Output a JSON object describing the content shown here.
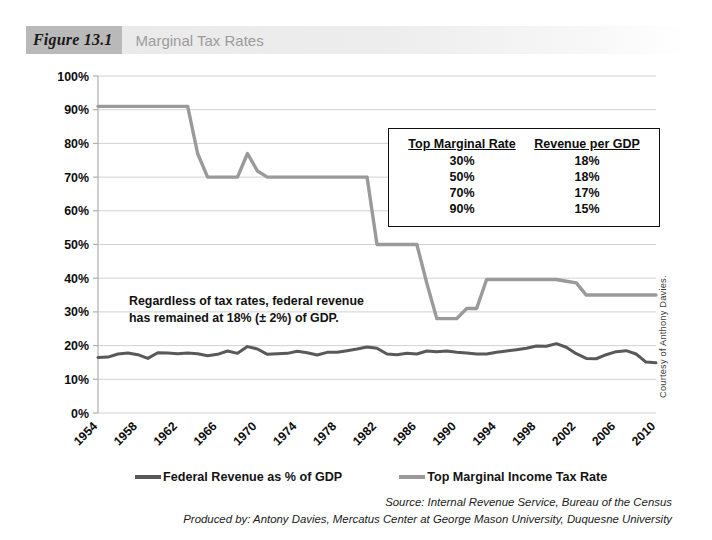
{
  "figure": {
    "badge": "Figure 13.1",
    "title": "Marginal Tax Rates"
  },
  "annotation": {
    "line1": "Regardless of tax rates, federal revenue",
    "line2": "has remained at 18% (± 2%) of GDP."
  },
  "inset_table": {
    "headers": [
      "Top Marginal Rate",
      "Revenue per GDP"
    ],
    "rows": [
      [
        "30%",
        "18%"
      ],
      [
        "50%",
        "18%"
      ],
      [
        "70%",
        "17%"
      ],
      [
        "90%",
        "15%"
      ]
    ]
  },
  "legend": {
    "items": [
      {
        "label": "Federal Revenue as % of GDP",
        "color": "#595959"
      },
      {
        "label": "Top Marginal Income Tax Rate",
        "color": "#9a9a9a"
      }
    ]
  },
  "source": {
    "line1": "Source: Internal Revenue Service, Bureau of the Census",
    "line2": "Produced by: Antony Davies, Mercatus Center at George Mason University, Duquesne University"
  },
  "credit": "Courtesy of Anthony Davies.",
  "colors": {
    "revenue_line": "#595959",
    "tax_line": "#9a9a9a",
    "gridline": "#d2d2d2",
    "axis": "#b0b0b0",
    "header_badge": "#b9b9b9",
    "header_title": "#9c9c9c"
  },
  "chart_data": {
    "type": "line",
    "title": "Marginal Tax Rates",
    "xlabel": "",
    "ylabel": "",
    "xlim": [
      1954,
      2010
    ],
    "ylim": [
      0,
      100
    ],
    "grid": true,
    "legend_position": "bottom",
    "ytick_labels": [
      "100%",
      "90%",
      "80%",
      "70%",
      "60%",
      "50%",
      "40%",
      "30%",
      "20%",
      "10%",
      "0%"
    ],
    "ytick_values": [
      100,
      90,
      80,
      70,
      60,
      50,
      40,
      30,
      20,
      10,
      0
    ],
    "xtick_labels": [
      "1954",
      "1958",
      "1962",
      "1966",
      "1970",
      "1974",
      "1978",
      "1982",
      "1986",
      "1990",
      "1994",
      "1998",
      "2002",
      "2006",
      "2010"
    ],
    "xtick_values": [
      1954,
      1958,
      1962,
      1966,
      1970,
      1974,
      1978,
      1982,
      1986,
      1990,
      1994,
      1998,
      2002,
      2006,
      2010
    ],
    "x": [
      1954,
      1955,
      1956,
      1957,
      1958,
      1959,
      1960,
      1961,
      1962,
      1963,
      1964,
      1965,
      1966,
      1967,
      1968,
      1969,
      1970,
      1971,
      1972,
      1973,
      1974,
      1975,
      1976,
      1977,
      1978,
      1979,
      1980,
      1981,
      1982,
      1983,
      1984,
      1985,
      1986,
      1987,
      1988,
      1989,
      1990,
      1991,
      1992,
      1993,
      1994,
      1995,
      1996,
      1997,
      1998,
      1999,
      2000,
      2001,
      2002,
      2003,
      2004,
      2005,
      2006,
      2007,
      2008,
      2009,
      2010
    ],
    "series": [
      {
        "name": "Top Marginal Income Tax Rate",
        "color": "#9a9a9a",
        "values": [
          91,
          91,
          91,
          91,
          91,
          91,
          91,
          91,
          91,
          91,
          77,
          70,
          70,
          70,
          70,
          77,
          71.8,
          70,
          70,
          70,
          70,
          70,
          70,
          70,
          70,
          70,
          70,
          70,
          50,
          50,
          50,
          50,
          50,
          38.5,
          28,
          28,
          28,
          31,
          31,
          39.6,
          39.6,
          39.6,
          39.6,
          39.6,
          39.6,
          39.6,
          39.6,
          39.1,
          38.6,
          35,
          35,
          35,
          35,
          35,
          35,
          35,
          35
        ]
      },
      {
        "name": "Federal Revenue as % of GDP",
        "color": "#595959",
        "values": [
          16.5,
          16.6,
          17.5,
          17.8,
          17.3,
          16.2,
          17.9,
          17.8,
          17.6,
          17.8,
          17.6,
          17.0,
          17.4,
          18.4,
          17.7,
          19.7,
          19.0,
          17.4,
          17.6,
          17.7,
          18.3,
          17.9,
          17.2,
          18.0,
          18.0,
          18.5,
          19.0,
          19.6,
          19.2,
          17.5,
          17.3,
          17.7,
          17.5,
          18.4,
          18.2,
          18.4,
          18.0,
          17.8,
          17.5,
          17.5,
          18.0,
          18.4,
          18.8,
          19.2,
          19.9,
          19.8,
          20.6,
          19.5,
          17.6,
          16.2,
          16.1,
          17.3,
          18.2,
          18.5,
          17.5,
          15.1,
          14.9
        ]
      }
    ]
  }
}
